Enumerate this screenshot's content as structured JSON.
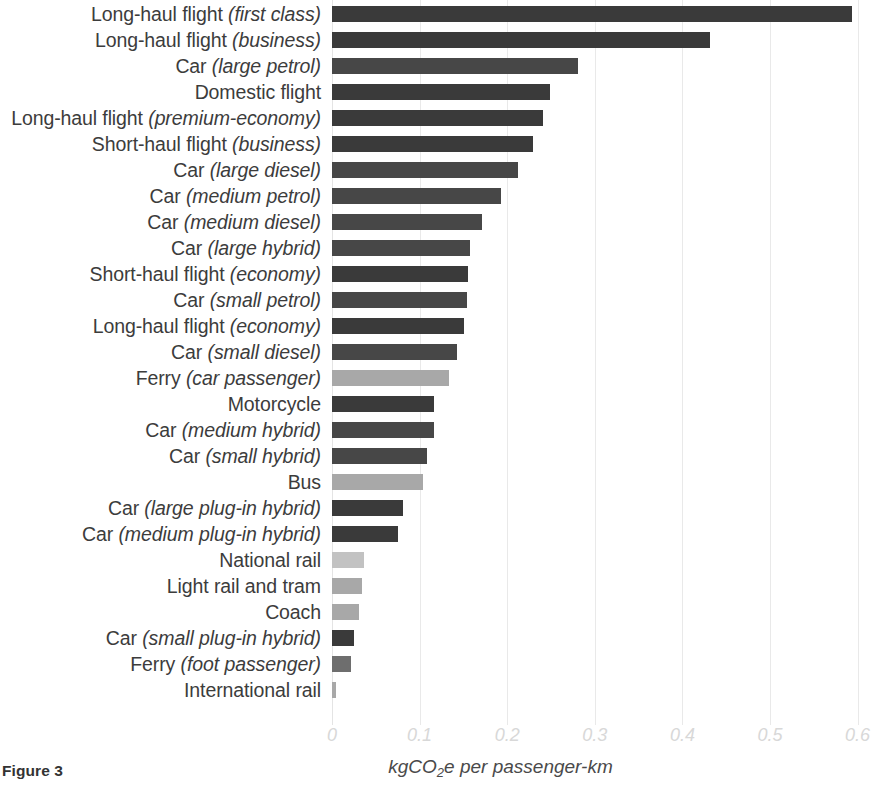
{
  "figure": {
    "caption": "Figure 3",
    "x_axis_title_main": "kgCO",
    "x_axis_title_sub": "2",
    "x_axis_title_rest": "e per passenger-km"
  },
  "colors": {
    "bar_dark": "#3a3a3a",
    "bar_mid": "#6e6e6e",
    "bar_light": "#a8a8a8",
    "bar_pale": "#c2c2c2",
    "gridline": "#e9e9e9",
    "tick_label": "#d8d8d8",
    "text": "#3c3c3c"
  },
  "chart_data": {
    "type": "bar",
    "orientation": "horizontal",
    "title": "",
    "xlabel": "kgCO2e per passenger-km",
    "ylabel": "",
    "xlim": [
      0,
      0.6
    ],
    "xticks": [
      "0",
      "0.1",
      "0.2",
      "0.3",
      "0.4",
      "0.5",
      "0.6"
    ],
    "xtick_values": [
      0,
      0.1,
      0.2,
      0.3,
      0.4,
      0.5,
      0.6
    ],
    "grid": "vertical",
    "legend": "none",
    "categories": [
      "Long-haul flight (first class)",
      "Long-haul flight (business)",
      "Car (large petrol)",
      "Domestic flight",
      "Long-haul flight (premium-economy)",
      "Short-haul flight (business)",
      "Car (large diesel)",
      "Car (medium petrol)",
      "Car (medium diesel)",
      "Car (large hybrid)",
      "Short-haul flight (economy)",
      "Car (small petrol)",
      "Long-haul flight (economy)",
      "Car (small diesel)",
      "Ferry (car passenger)",
      "Motorcycle",
      "Car (medium hybrid)",
      "Car (small hybrid)",
      "Bus",
      "Car (large plug-in hybrid)",
      "Car (medium plug-in hybrid)",
      "National rail",
      "Light rail and tram",
      "Coach",
      "Car (small plug-in hybrid)",
      "Ferry (foot passenger)",
      "International rail"
    ],
    "values": [
      0.594,
      0.431,
      0.281,
      0.249,
      0.241,
      0.229,
      0.212,
      0.193,
      0.171,
      0.157,
      0.155,
      0.154,
      0.151,
      0.143,
      0.133,
      0.117,
      0.116,
      0.109,
      0.104,
      0.081,
      0.075,
      0.037,
      0.034,
      0.031,
      0.025,
      0.022,
      0.005
    ]
  },
  "rows": [
    {
      "plain": "Long-haul flight ",
      "italic": "(first class)",
      "value": 0.594,
      "shade": "dark"
    },
    {
      "plain": "Long-haul flight ",
      "italic": "(business)",
      "value": 0.431,
      "shade": "dark"
    },
    {
      "plain": "Car ",
      "italic": "(large petrol)",
      "value": 0.281,
      "shade": "mid-dark"
    },
    {
      "plain": "Domestic flight",
      "italic": "",
      "value": 0.249,
      "shade": "dark"
    },
    {
      "plain": "Long-haul flight ",
      "italic": "(premium-economy)",
      "value": 0.241,
      "shade": "dark"
    },
    {
      "plain": "Short-haul flight ",
      "italic": "(business)",
      "value": 0.229,
      "shade": "dark"
    },
    {
      "plain": "Car ",
      "italic": "(large diesel)",
      "value": 0.212,
      "shade": "mid-dark"
    },
    {
      "plain": "Car ",
      "italic": "(medium petrol)",
      "value": 0.193,
      "shade": "mid-dark"
    },
    {
      "plain": "Car ",
      "italic": "(medium diesel)",
      "value": 0.171,
      "shade": "mid-dark"
    },
    {
      "plain": "Car ",
      "italic": "(large hybrid)",
      "value": 0.157,
      "shade": "mid-dark"
    },
    {
      "plain": "Short-haul flight ",
      "italic": "(economy)",
      "value": 0.155,
      "shade": "dark"
    },
    {
      "plain": "Car ",
      "italic": "(small petrol)",
      "value": 0.154,
      "shade": "mid-dark"
    },
    {
      "plain": "Long-haul flight ",
      "italic": "(economy)",
      "value": 0.151,
      "shade": "dark"
    },
    {
      "plain": "Car ",
      "italic": "(small diesel)",
      "value": 0.143,
      "shade": "mid-dark"
    },
    {
      "plain": "Ferry ",
      "italic": "(car passenger)",
      "value": 0.133,
      "shade": "light"
    },
    {
      "plain": "Motorcycle",
      "italic": "",
      "value": 0.117,
      "shade": "dark"
    },
    {
      "plain": "Car ",
      "italic": "(medium hybrid)",
      "value": 0.116,
      "shade": "mid-dark"
    },
    {
      "plain": "Car ",
      "italic": "(small hybrid)",
      "value": 0.109,
      "shade": "mid-dark"
    },
    {
      "plain": "Bus",
      "italic": "",
      "value": 0.104,
      "shade": "light"
    },
    {
      "plain": "Car ",
      "italic": "(large plug-in hybrid)",
      "value": 0.081,
      "shade": "dark"
    },
    {
      "plain": "Car ",
      "italic": "(medium plug-in hybrid)",
      "value": 0.075,
      "shade": "dark"
    },
    {
      "plain": "National rail",
      "italic": "",
      "value": 0.037,
      "shade": "pale"
    },
    {
      "plain": "Light rail and tram",
      "italic": "",
      "value": 0.034,
      "shade": "light"
    },
    {
      "plain": "Coach",
      "italic": "",
      "value": 0.031,
      "shade": "light"
    },
    {
      "plain": "Car ",
      "italic": "(small plug-in hybrid)",
      "value": 0.025,
      "shade": "dark"
    },
    {
      "plain": "Ferry ",
      "italic": "(foot passenger)",
      "value": 0.022,
      "shade": "mid"
    },
    {
      "plain": "International rail",
      "italic": "",
      "value": 0.005,
      "shade": "light"
    }
  ]
}
